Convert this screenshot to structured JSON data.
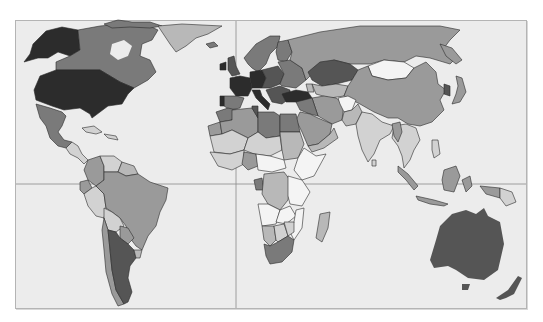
{
  "map": {
    "type": "choropleth",
    "projection": "world-equirectangular-like",
    "color_scheme": "grayscale",
    "shades": {
      "darkest": "#2c2c2c",
      "dark": "#555555",
      "medium_dark": "#7a7a7a",
      "medium": "#9a9a9a",
      "light": "#b8b8b8",
      "lighter": "#d2d2d2",
      "lightest": "#f4f4f4",
      "ocean": "#ececec",
      "border": "#2a2a2a",
      "gridline": "#8a8a8a"
    },
    "gridlines": {
      "vertical_x": 236,
      "horizontal_y": 184
    },
    "regions": [
      {
        "name": "United States",
        "shade": "darkest"
      },
      {
        "name": "Alaska",
        "shade": "darkest"
      },
      {
        "name": "Canada",
        "shade": "medium_dark"
      },
      {
        "name": "Greenland",
        "shade": "light"
      },
      {
        "name": "Mexico",
        "shade": "medium_dark"
      },
      {
        "name": "Central America",
        "shade": "lighter"
      },
      {
        "name": "Caribbean",
        "shade": "lighter"
      },
      {
        "name": "Colombia",
        "shade": "medium"
      },
      {
        "name": "Venezuela",
        "shade": "lighter"
      },
      {
        "name": "Guyanas",
        "shade": "light"
      },
      {
        "name": "Ecuador",
        "shade": "medium"
      },
      {
        "name": "Peru",
        "shade": "lighter"
      },
      {
        "name": "Brazil",
        "shade": "medium"
      },
      {
        "name": "Bolivia",
        "shade": "lighter"
      },
      {
        "name": "Paraguay",
        "shade": "medium"
      },
      {
        "name": "Chile",
        "shade": "medium"
      },
      {
        "name": "Argentina",
        "shade": "dark"
      },
      {
        "name": "Uruguay",
        "shade": "light"
      },
      {
        "name": "Iceland",
        "shade": "medium_dark"
      },
      {
        "name": "United Kingdom",
        "shade": "dark"
      },
      {
        "name": "Ireland",
        "shade": "darkest"
      },
      {
        "name": "Scandinavia",
        "shade": "medium_dark"
      },
      {
        "name": "Finland",
        "shade": "medium_dark"
      },
      {
        "name": "France",
        "shade": "darkest"
      },
      {
        "name": "Spain",
        "shade": "medium_dark"
      },
      {
        "name": "Portugal",
        "shade": "darkest"
      },
      {
        "name": "Germany",
        "shade": "darkest"
      },
      {
        "name": "Italy",
        "shade": "darkest"
      },
      {
        "name": "Central Europe",
        "shade": "dark"
      },
      {
        "name": "Eastern Europe",
        "shade": "medium_dark"
      },
      {
        "name": "Balkans",
        "shade": "dark"
      },
      {
        "name": "Turkey",
        "shade": "darkest"
      },
      {
        "name": "Russia",
        "shade": "medium"
      },
      {
        "name": "Kazakhstan",
        "shade": "dark"
      },
      {
        "name": "Central Asia",
        "shade": "light"
      },
      {
        "name": "Mongolia",
        "shade": "lightest"
      },
      {
        "name": "China",
        "shade": "medium"
      },
      {
        "name": "Korea",
        "shade": "dark"
      },
      {
        "name": "Japan",
        "shade": "medium"
      },
      {
        "name": "Iran",
        "shade": "medium"
      },
      {
        "name": "Afghanistan",
        "shade": "lightest"
      },
      {
        "name": "Pakistan",
        "shade": "light"
      },
      {
        "name": "India",
        "shade": "lighter"
      },
      {
        "name": "Southeast Asia",
        "shade": "lighter"
      },
      {
        "name": "Indonesia",
        "shade": "medium"
      },
      {
        "name": "Papua New Guinea",
        "shade": "lighter"
      },
      {
        "name": "Philippines",
        "shade": "lighter"
      },
      {
        "name": "Australia",
        "shade": "dark"
      },
      {
        "name": "New Zealand",
        "shade": "dark"
      },
      {
        "name": "Saudi Arabia",
        "shade": "medium"
      },
      {
        "name": "Middle East",
        "shade": "medium_dark"
      },
      {
        "name": "Morocco",
        "shade": "medium_dark"
      },
      {
        "name": "Western Sahara",
        "shade": "medium"
      },
      {
        "name": "Algeria",
        "shade": "medium"
      },
      {
        "name": "Libya",
        "shade": "medium_dark"
      },
      {
        "name": "Egypt",
        "shade": "medium_dark"
      },
      {
        "name": "Mauritania/Mali",
        "shade": "lighter"
      },
      {
        "name": "Niger/Chad",
        "shade": "lighter"
      },
      {
        "name": "Sudan",
        "shade": "light"
      },
      {
        "name": "West Africa",
        "shade": "lighter"
      },
      {
        "name": "Nigeria",
        "shade": "medium"
      },
      {
        "name": "Horn of Africa",
        "shade": "lightest"
      },
      {
        "name": "Central Africa",
        "shade": "lightest"
      },
      {
        "name": "DR Congo",
        "shade": "light"
      },
      {
        "name": "Gabon",
        "shade": "medium_dark"
      },
      {
        "name": "East Africa",
        "shade": "lightest"
      },
      {
        "name": "Angola",
        "shade": "lightest"
      },
      {
        "name": "Namibia",
        "shade": "light"
      },
      {
        "name": "Botswana",
        "shade": "lighter"
      },
      {
        "name": "Zimbabwe",
        "shade": "lighter"
      },
      {
        "name": "Mozambique",
        "shade": "lightest"
      },
      {
        "name": "South Africa",
        "shade": "medium_dark"
      },
      {
        "name": "Madagascar",
        "shade": "light"
      }
    ]
  }
}
